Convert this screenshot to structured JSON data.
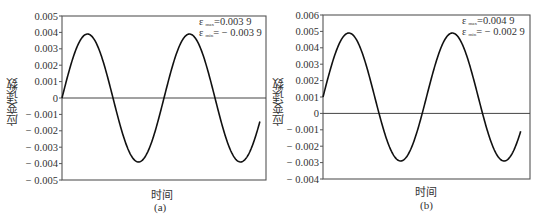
{
  "chart_data": [
    {
      "type": "line",
      "panel": "(a)",
      "title": "",
      "xlabel": "时间",
      "ylabel": "应变读数",
      "caption": "(a)",
      "ylim": [
        -0.005,
        0.005
      ],
      "yticks": [
        0.005,
        0.004,
        0.003,
        0.002,
        0.001,
        0,
        -0.001,
        -0.002,
        -0.003,
        -0.004,
        -0.005
      ],
      "ytick_labels": [
        "0.005",
        "0.004",
        "0.003",
        "0.002",
        "0.001",
        "0",
        "− 0.001",
        "− 0.002",
        "− 0.003",
        "− 0.004",
        "− 0.005"
      ],
      "grid": false,
      "zero_line": true,
      "annotations": [
        {
          "symbol": "ε",
          "sub": "max",
          "text": "=0.003 9"
        },
        {
          "symbol": "ε",
          "sub": "min",
          "text": "= − 0.003 9"
        }
      ],
      "series": [
        {
          "name": "strain",
          "description": "sinusoid, amplitude 0.0039, mean 0, ~2 cycles",
          "x_fraction": [
            0.0,
            0.06,
            0.125,
            0.19,
            0.25,
            0.315,
            0.375,
            0.44,
            0.5,
            0.56,
            0.625,
            0.69,
            0.75,
            0.815,
            0.875,
            0.94,
            0.97
          ],
          "values": [
            0.0,
            0.0028,
            0.0039,
            0.0028,
            0.0,
            -0.0028,
            -0.0039,
            -0.0028,
            0.0,
            0.0028,
            0.0039,
            0.0028,
            0.0,
            -0.0028,
            -0.0039,
            -0.0035,
            -0.003
          ]
        }
      ],
      "max": 0.0039,
      "min": -0.0039
    },
    {
      "type": "line",
      "panel": "(b)",
      "title": "",
      "xlabel": "时间",
      "ylabel": "应变读数",
      "caption": "(b)",
      "ylim": [
        -0.004,
        0.006
      ],
      "yticks": [
        0.006,
        0.005,
        0.004,
        0.003,
        0.002,
        0.001,
        0,
        -0.001,
        -0.002,
        -0.003,
        -0.004
      ],
      "ytick_labels": [
        "0.006",
        "0.005",
        "0.004",
        "0.003",
        "0.002",
        "0.001",
        "0",
        "− 0.001",
        "− 0.002",
        "− 0.003",
        "− 0.004"
      ],
      "grid": false,
      "zero_line": true,
      "annotations": [
        {
          "symbol": "ε",
          "sub": "max",
          "text": "=0.004 9"
        },
        {
          "symbol": "ε",
          "sub": "min",
          "text": "= − 0.002 9"
        }
      ],
      "series": [
        {
          "name": "strain",
          "description": "sinusoid, amplitude 0.0039, mean 0.001, ~2 cycles",
          "x_fraction": [
            0.0,
            0.06,
            0.125,
            0.19,
            0.25,
            0.315,
            0.375,
            0.44,
            0.5,
            0.56,
            0.625,
            0.69,
            0.75,
            0.815,
            0.875,
            0.94,
            0.955
          ],
          "values": [
            0.001,
            0.0038,
            0.0049,
            0.0038,
            0.001,
            -0.0018,
            -0.0029,
            -0.0018,
            0.001,
            0.0038,
            0.0049,
            0.0038,
            0.001,
            -0.0018,
            -0.0029,
            -0.0024,
            -0.002
          ]
        }
      ],
      "max": 0.0049,
      "min": -0.0029
    }
  ]
}
